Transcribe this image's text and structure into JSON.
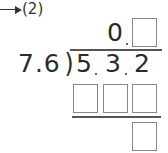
{
  "problem": {
    "label": "(2)",
    "pointer_icon": "arrow-right-icon"
  },
  "quotient": {
    "digits": [
      "0"
    ],
    "answer_boxes": 1
  },
  "divisor": {
    "text": "7.6"
  },
  "dividend": {
    "digits": [
      "5",
      "3",
      "2"
    ],
    "text": "5.3.2"
  },
  "work": {
    "product_boxes": 3,
    "remainder_boxes": 1
  }
}
